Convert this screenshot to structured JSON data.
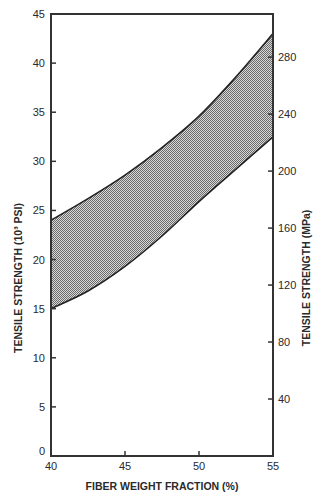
{
  "chart_data": {
    "type": "area",
    "title": "",
    "xlabel": "FIBER WEIGHT FRACTION (%)",
    "ylabel_left": "TENSILE STRENGTH (10³ PSI)",
    "ylabel_right": "TENSILE STRENGTH (MPa)",
    "xlim": [
      40,
      55
    ],
    "ylim_left": [
      0,
      45
    ],
    "ylim_right_mpa_per_ksi": 6.895,
    "x_ticks": [
      40,
      45,
      50,
      55
    ],
    "x_tick_labels": [
      "40",
      "45",
      "50",
      "55"
    ],
    "y_left_ticks": [
      0,
      5,
      10,
      15,
      20,
      25,
      30,
      35,
      40,
      45
    ],
    "y_left_tick_labels": [
      "0",
      "5",
      "10",
      "15",
      "20",
      "25",
      "30",
      "35",
      "40",
      "45"
    ],
    "y_right_ticks": [
      40,
      80,
      120,
      160,
      200,
      240,
      280
    ],
    "y_right_tick_labels": [
      "40",
      "80",
      "120",
      "160",
      "200",
      "240",
      "280"
    ],
    "grid": false,
    "legend": "none",
    "fill": "stippled gray band between upper and lower bounds",
    "x": [
      40,
      42.5,
      45,
      47.5,
      50,
      52.5,
      55
    ],
    "series": [
      {
        "name": "upper bound",
        "values": [
          24.0,
          26.2,
          28.6,
          31.4,
          34.6,
          38.6,
          43.0
        ]
      },
      {
        "name": "lower bound",
        "values": [
          15.0,
          16.8,
          19.3,
          22.4,
          25.9,
          29.2,
          32.5
        ]
      }
    ]
  }
}
